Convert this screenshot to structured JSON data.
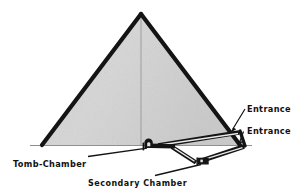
{
  "figure": {
    "background_color": "#ffffff",
    "stone_fill_color": "#d2d2d2",
    "outline_color": "#111111",
    "ground_line_color": "#8a8a8a",
    "label_color": "#111111"
  },
  "labels": {
    "entrance_upper": "Entrance",
    "entrance_lower": "Entrance",
    "tomb_chamber": "Tomb-Chamber",
    "secondary_chamber": "Secondary Chamber"
  },
  "diagram_data": {
    "type": "diagram",
    "subject": "Egyptian pyramid sectional view",
    "elements": [
      {
        "name": "pyramid-body",
        "shape": "triangle",
        "apex": [
          141,
          14
        ],
        "base_left": [
          42,
          145
        ],
        "base_right": [
          240,
          145
        ],
        "fill": "#d2d2d2",
        "stroke": "#111111"
      },
      {
        "name": "pyramid-axis",
        "shape": "vertical-centerline",
        "from": [
          141,
          14
        ],
        "to": [
          141,
          145
        ],
        "stroke": "#9a9a9a"
      },
      {
        "name": "ground-line",
        "shape": "horizontal-line",
        "from": [
          30,
          145
        ],
        "to": [
          250,
          145
        ],
        "stroke": "#8a8a8a"
      },
      {
        "name": "upper-entrance-passage",
        "shape": "descending-corridor",
        "from": [
          238,
          133
        ],
        "to": [
          150,
          146
        ]
      },
      {
        "name": "lower-entrance-passage",
        "shape": "descending-corridor",
        "from": [
          243,
          145
        ],
        "to": [
          196,
          163
        ]
      },
      {
        "name": "tomb-chamber",
        "shape": "arched-chamber",
        "position": [
          146,
          140
        ],
        "size": [
          12,
          9
        ]
      },
      {
        "name": "secondary-chamber",
        "shape": "small-box-chamber",
        "position": [
          199,
          160
        ],
        "size": [
          10,
          7
        ]
      }
    ],
    "callouts": [
      {
        "label": "Entrance",
        "text_anchor": [
          246,
          112
        ],
        "arrow_from": [
          244,
          108
        ],
        "arrow_to": [
          230,
          131
        ]
      },
      {
        "label": "Entrance",
        "text_anchor": [
          246,
          134
        ],
        "arrow_from": [
          243,
          130
        ],
        "arrow_to": [
          237,
          146
        ]
      },
      {
        "label": "Tomb-Chamber",
        "text_anchor": [
          13,
          166
        ],
        "arrow_from": [
          88,
          157
        ],
        "arrow_to": [
          148,
          148
        ]
      },
      {
        "label": "Secondary Chamber",
        "text_anchor": [
          88,
          185
        ],
        "arrow_from": [
          155,
          176
        ],
        "arrow_to": [
          203,
          164
        ]
      }
    ]
  }
}
